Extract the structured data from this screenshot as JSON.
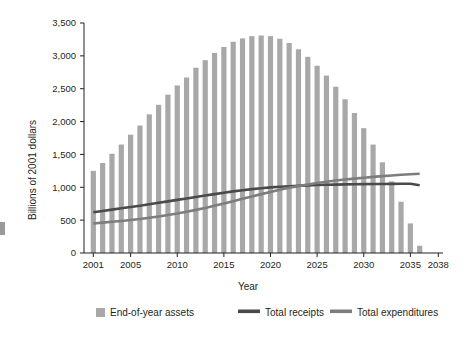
{
  "chart_data": {
    "type": "bar",
    "title": "",
    "subtitle": "",
    "xlabel": "Year",
    "ylabel": "Billions of 2001 dollars",
    "xlim": [
      2000,
      2038.5
    ],
    "ylim": [
      0,
      3500
    ],
    "grid": false,
    "legend_position": "bottom",
    "x_tick_labels": [
      "2001",
      "2005",
      "2010",
      "2015",
      "2020",
      "2025",
      "2030",
      "2035",
      "2038"
    ],
    "x_tick_values": [
      2001,
      2005,
      2010,
      2015,
      2020,
      2025,
      2030,
      2035,
      2038
    ],
    "y_tick_labels": [
      "0",
      "500",
      "1,000",
      "1,500",
      "2,000",
      "2,500",
      "3,000",
      "3,500"
    ],
    "y_tick_values": [
      0,
      500,
      1000,
      1500,
      2000,
      2500,
      3000,
      3500
    ],
    "categories": [
      2001,
      2002,
      2003,
      2004,
      2005,
      2006,
      2007,
      2008,
      2009,
      2010,
      2011,
      2012,
      2013,
      2014,
      2015,
      2016,
      2017,
      2018,
      2019,
      2020,
      2021,
      2022,
      2023,
      2024,
      2025,
      2026,
      2027,
      2028,
      2029,
      2030,
      2031,
      2032,
      2033,
      2034,
      2035,
      2036,
      2037,
      2038
    ],
    "series": [
      {
        "name": "End-of-year assets",
        "type": "bar",
        "color": "#a8a8a8",
        "values": [
          1250,
          1370,
          1510,
          1650,
          1800,
          1940,
          2110,
          2255,
          2410,
          2550,
          2670,
          2820,
          2935,
          3045,
          3135,
          3215,
          3265,
          3300,
          3310,
          3300,
          3260,
          3195,
          3100,
          2985,
          2850,
          2700,
          2530,
          2340,
          2130,
          1900,
          1650,
          1380,
          1090,
          780,
          450,
          110,
          0,
          0
        ]
      },
      {
        "name": "Total receipts",
        "type": "line",
        "color": "#4a4a4a",
        "values": [
          620,
          640,
          660,
          680,
          700,
          720,
          742,
          764,
          786,
          808,
          830,
          852,
          874,
          896,
          918,
          938,
          956,
          972,
          986,
          998,
          1008,
          1016,
          1023,
          1029,
          1034,
          1038,
          1041,
          1044,
          1046,
          1048,
          1050,
          1051,
          1052,
          1053,
          1053,
          1030,
          null,
          null
        ]
      },
      {
        "name": "Total expenditures",
        "type": "line",
        "color": "#7d7d7d",
        "values": [
          450,
          462,
          475,
          488,
          502,
          518,
          536,
          556,
          578,
          602,
          628,
          656,
          686,
          718,
          752,
          788,
          824,
          860,
          896,
          930,
          962,
          992,
          1018,
          1042,
          1064,
          1084,
          1102,
          1118,
          1132,
          1146,
          1158,
          1170,
          1180,
          1190,
          1198,
          1205,
          null,
          null
        ]
      }
    ],
    "legend": [
      {
        "label": "End-of-year assets",
        "marker": "square",
        "color": "#a8a8a8"
      },
      {
        "label": "Total receipts",
        "marker": "line",
        "color": "#4a4a4a"
      },
      {
        "label": "Total expenditures",
        "marker": "line",
        "color": "#7d7d7d"
      }
    ]
  }
}
